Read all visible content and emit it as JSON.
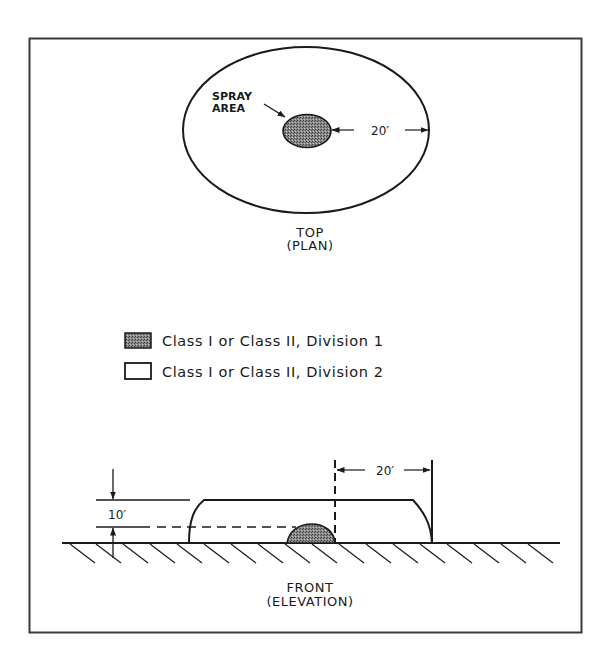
{
  "diagram": {
    "type": "hazardous-location-classification",
    "frame": {
      "stroke": "#3a3a3a"
    },
    "top_view": {
      "title_line1": "TOP",
      "title_line2": "(PLAN)",
      "spray_label_line1": "SPRAY",
      "spray_label_line2": "AREA",
      "radius_dimension": "20′"
    },
    "legend": {
      "items": [
        {
          "swatch": "hatched-dark",
          "label": "Class I or Class II, Division 1"
        },
        {
          "swatch": "empty",
          "label": "Class I or Class II, Division 2"
        }
      ]
    },
    "front_view": {
      "title_line1": "FRONT",
      "title_line2": "(ELEVATION)",
      "height_dimension": "10′",
      "horizontal_dimension": "20′"
    },
    "colors": {
      "line": "#1a1a1a",
      "division1_fill": "#7a7a7a",
      "background": "#ffffff"
    }
  }
}
